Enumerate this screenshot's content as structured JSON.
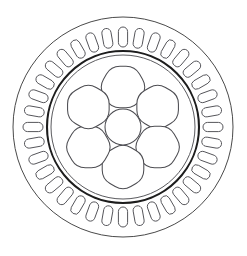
{
  "figure": {
    "kind": "motor-cross-section",
    "title": "",
    "background_color": "#ffffff",
    "width": 247,
    "height": 256
  },
  "geometry": {
    "center": {
      "x": 123,
      "y": 127
    },
    "stator_outer": {
      "label": "stator-outer-circle",
      "radius": 110,
      "stroke_color": "#4a4a4a",
      "stroke_width": 1
    },
    "stator_slot_ring": {
      "label": "stator-slot-ring",
      "count": 36,
      "slot_shape": "capsule",
      "slot_inner_radius": 80,
      "slot_outer_radius": 100,
      "slot_half_width": 4.6,
      "stroke_color": "#55555a",
      "fill_color": "#ffffff"
    },
    "rotor_boundary": {
      "label": "rotor-boundary-circle",
      "radius": 76,
      "stroke_color": "#1d1d1d",
      "stroke_width": 2.1
    },
    "rotor_inner_ring": {
      "label": "rotor-inner-ring",
      "radius": 72,
      "stroke_color": "#5a5a5e",
      "stroke_width": 1
    },
    "flux_holes": {
      "label": "rotor-flux-barrier-holes",
      "count": 6,
      "shape": "rounded-hexagon",
      "orbit_radius": 40,
      "hole_radius": 24,
      "corner_round": 9,
      "start_angle_deg": -90,
      "stroke_color": "#4d4d52",
      "fill_color": "#ffffff"
    },
    "shaft_hole": {
      "label": "center-shaft-hole",
      "radius": 18,
      "stroke_color": "#4d4d52",
      "fill_color": "#ffffff"
    }
  }
}
